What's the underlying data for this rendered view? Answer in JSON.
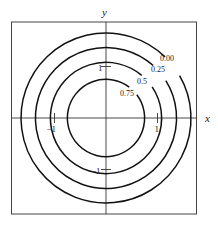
{
  "chart_data": {
    "type": "contour",
    "title": "",
    "xlabel": "x",
    "ylabel": "y",
    "xlim": [
      -1.8,
      1.8
    ],
    "ylim": [
      -1.8,
      1.8
    ],
    "grid": false,
    "x_ticks": [
      {
        "value": -1,
        "label": "−1"
      },
      {
        "value": 1,
        "label": "1"
      }
    ],
    "y_ticks": [
      {
        "value": 1,
        "label": "1"
      },
      {
        "value": -1,
        "label": "−1"
      }
    ],
    "levels": [
      {
        "value": 0.0,
        "label": "0.00",
        "radius": 1.65
      },
      {
        "value": 0.25,
        "label": "0.25",
        "radius": 1.37
      },
      {
        "value": 0.5,
        "label": "0.5",
        "radius": 1.08
      },
      {
        "value": 0.75,
        "label": "0.75",
        "radius": 0.75
      }
    ],
    "shape": "concentric circles centered at origin"
  }
}
